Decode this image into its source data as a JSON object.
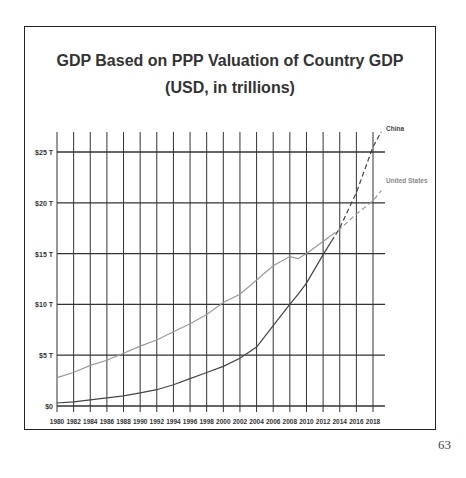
{
  "chart_data": {
    "type": "line",
    "title": "GDP Based on PPP Valuation of Country GDP",
    "subtitle": "(USD, in trillions)",
    "xlabel": "",
    "ylabel": "",
    "ylim": [
      0,
      25
    ],
    "yticks": [
      "$0",
      "$5 T",
      "$10 T",
      "$15 T",
      "$20 T",
      "$25 T"
    ],
    "ytick_values": [
      0,
      5,
      10,
      15,
      20,
      25
    ],
    "xticks": [
      "1980",
      "1982",
      "1984",
      "1986",
      "1988",
      "1990",
      "1992",
      "1994",
      "1996",
      "1998",
      "2000",
      "2002",
      "2004",
      "2006",
      "2008",
      "2010",
      "2012",
      "2014",
      "2016",
      "2018"
    ],
    "grid": true,
    "legend_position": "right, inline labels at line ends",
    "x": [
      1980,
      1982,
      1984,
      1986,
      1988,
      1990,
      1992,
      1994,
      1996,
      1998,
      2000,
      2002,
      2004,
      2006,
      2008,
      2009,
      2010,
      2012,
      2014,
      2016,
      2018,
      2019
    ],
    "series": [
      {
        "name": "China",
        "color": "#444444",
        "style": "solid through ~2013, dashed (projection) after",
        "values": [
          0.3,
          0.4,
          0.6,
          0.8,
          1.0,
          1.3,
          1.6,
          2.1,
          2.7,
          3.3,
          3.9,
          4.7,
          5.8,
          7.9,
          10.0,
          11.0,
          12.1,
          14.9,
          17.5,
          21.0,
          25.5,
          27.0
        ]
      },
      {
        "name": "United States",
        "color": "#999999",
        "style": "solid through ~2013, dashed (projection) after",
        "values": [
          2.8,
          3.3,
          4.0,
          4.5,
          5.2,
          5.9,
          6.5,
          7.3,
          8.1,
          9.0,
          10.2,
          11.0,
          12.4,
          13.8,
          14.7,
          14.5,
          15.0,
          16.2,
          17.4,
          18.9,
          20.2,
          21.2
        ]
      }
    ]
  },
  "page": {
    "number": "63"
  }
}
